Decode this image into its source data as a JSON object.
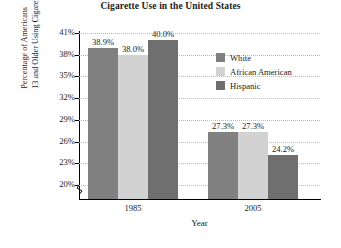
{
  "chart_data": {
    "type": "bar",
    "title": "Cigarette Use in the United States",
    "xlabel": "Year",
    "ylabel_line1": "Percentage of Americans",
    "ylabel_line2": "13 and Older Using Cigarettes",
    "categories": [
      "1985",
      "2005"
    ],
    "series": [
      {
        "name": "White",
        "values": [
          38.9,
          27.3
        ],
        "labels": [
          "38.9%",
          "27.3%"
        ],
        "color": "#808080"
      },
      {
        "name": "African American",
        "values": [
          38.0,
          27.3
        ],
        "labels": [
          "38.0%",
          "27.3%"
        ],
        "color": "#d2d2d2"
      },
      {
        "name": "Hispanic",
        "values": [
          40.0,
          24.2
        ],
        "labels": [
          "40.0%",
          "24.2%"
        ],
        "color": "#6f6f6f"
      }
    ],
    "ytick_labels": [
      "41%",
      "38%",
      "35%",
      "32%",
      "29%",
      "26%",
      "23%",
      "20%"
    ],
    "ytick_values": [
      41,
      38,
      35,
      32,
      29,
      26,
      23,
      20
    ],
    "ylim": [
      20,
      41
    ],
    "ytick_step": 3,
    "axis_break": true,
    "grid": "horizontal-dotted",
    "legend_position": "inside-right-top"
  }
}
